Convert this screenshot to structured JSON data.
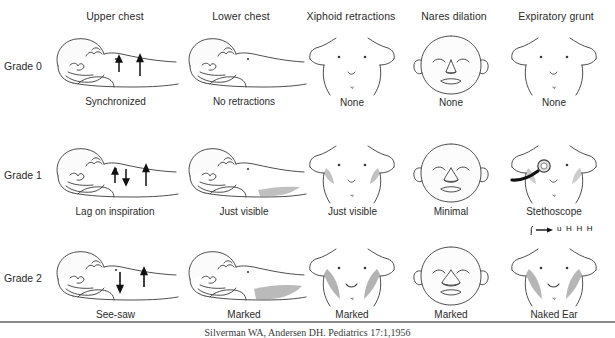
{
  "figure": {
    "row_label_prefix": "Grade",
    "rule_color": "#8a8a8a",
    "shade_color": "#9a9a9a",
    "line_color": "#3a3a3a"
  },
  "columns": [
    {
      "id": "upper-chest",
      "header": "Upper chest"
    },
    {
      "id": "lower-chest",
      "header": "Lower chest"
    },
    {
      "id": "xiphoid-retractions",
      "header": "Xiphoid retractions"
    },
    {
      "id": "nares-dilation",
      "header": "Nares dilation"
    },
    {
      "id": "expiratory-grunt",
      "header": "Expiratory grunt"
    }
  ],
  "rows": [
    {
      "id": "grade-0",
      "label": "Grade 0",
      "cells": [
        {
          "column": "upper-chest",
          "caption": "Synchronized"
        },
        {
          "column": "lower-chest",
          "caption": "No retractions"
        },
        {
          "column": "xiphoid-retractions",
          "caption": "None"
        },
        {
          "column": "nares-dilation",
          "caption": "None"
        },
        {
          "column": "expiratory-grunt",
          "caption": "None"
        }
      ]
    },
    {
      "id": "grade-1",
      "label": "Grade 1",
      "cells": [
        {
          "column": "upper-chest",
          "caption": "Lag on inspiration"
        },
        {
          "column": "lower-chest",
          "caption": "Just visible"
        },
        {
          "column": "xiphoid-retractions",
          "caption": "Just visible"
        },
        {
          "column": "nares-dilation",
          "caption": "Minimal"
        },
        {
          "column": "expiratory-grunt",
          "caption": "Stethoscope"
        }
      ]
    },
    {
      "id": "grade-2",
      "label": "Grade 2",
      "cells": [
        {
          "column": "upper-chest",
          "caption": "See-saw"
        },
        {
          "column": "lower-chest",
          "caption": "Marked"
        },
        {
          "column": "xiphoid-retractions",
          "caption": "Marked"
        },
        {
          "column": "nares-dilation",
          "caption": "Marked"
        },
        {
          "column": "expiratory-grunt",
          "caption": "Naked Ear"
        }
      ]
    }
  ],
  "annotations": {
    "grunt_sound": "u H H H"
  },
  "footer": {
    "caption": "Silverman WA, Andersen DH. Pediatrics 17:1,1956"
  }
}
